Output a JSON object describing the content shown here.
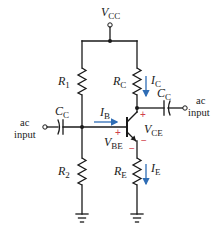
{
  "diagram": {
    "colors": {
      "wire": "#1a1a1a",
      "current_arrow": "#2f6db5",
      "polarity": "#d0404a"
    },
    "supply": {
      "symbol": "V",
      "subscript": "CC"
    },
    "resistors": {
      "r1": {
        "symbol": "R",
        "subscript": "1"
      },
      "r2": {
        "symbol": "R",
        "subscript": "2"
      },
      "rc": {
        "symbol": "R",
        "subscript": "C"
      },
      "re": {
        "symbol": "R",
        "subscript": "E"
      }
    },
    "capacitors": {
      "input": {
        "symbol": "C",
        "subscript": "C"
      },
      "output": {
        "symbol": "C",
        "subscript": "C"
      }
    },
    "currents": {
      "ib": {
        "symbol": "I",
        "subscript": "B"
      },
      "ic": {
        "symbol": "I",
        "subscript": "C"
      },
      "ie": {
        "symbol": "I",
        "subscript": "E"
      }
    },
    "voltages": {
      "vbe": {
        "symbol": "V",
        "subscript": "BE"
      },
      "vce": {
        "symbol": "V",
        "subscript": "CE"
      }
    },
    "polarity": {
      "plus": "+",
      "minus": "−"
    },
    "terminals": {
      "left": {
        "line1": "ac",
        "line2": "input"
      },
      "right": {
        "line1": "ac",
        "line2": "input"
      }
    }
  }
}
